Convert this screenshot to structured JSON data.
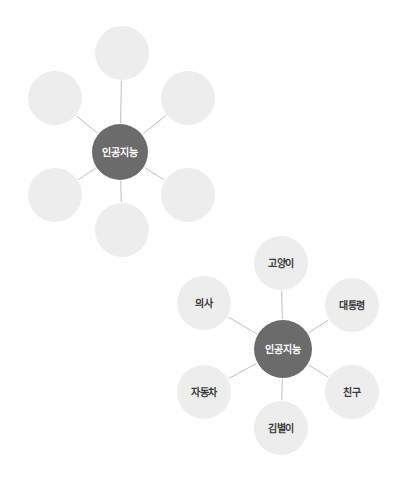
{
  "page": {
    "background_color": "#ffffff",
    "width": 410,
    "height": 497
  },
  "style": {
    "hub_fill": "#6b6b6b",
    "hub_text_color": "#ffffff",
    "leaf_fill": "#ededed",
    "leaf_text_color": "#3a3a3a",
    "edge_color": "#bfbfbf"
  },
  "diagrams": [
    {
      "id": "diagram-unlabeled",
      "name": "radial-diagram-unlabeled",
      "center": {
        "label": "인공지능",
        "x": 120,
        "y": 152,
        "r": 28
      },
      "nodes": [
        {
          "label": "",
          "x": 122,
          "y": 53,
          "r": 27
        },
        {
          "label": "",
          "x": 188,
          "y": 98,
          "r": 27
        },
        {
          "label": "",
          "x": 188,
          "y": 195,
          "r": 27
        },
        {
          "label": "",
          "x": 122,
          "y": 230,
          "r": 27
        },
        {
          "label": "",
          "x": 55,
          "y": 195,
          "r": 27
        },
        {
          "label": "",
          "x": 55,
          "y": 98,
          "r": 27
        }
      ]
    },
    {
      "id": "diagram-labeled",
      "name": "radial-diagram-labeled",
      "center": {
        "label": "인공지능",
        "x": 283,
        "y": 349,
        "r": 29
      },
      "nodes": [
        {
          "label": "고양이",
          "x": 281,
          "y": 263,
          "r": 27
        },
        {
          "label": "대통령",
          "x": 352,
          "y": 305,
          "r": 27
        },
        {
          "label": "친구",
          "x": 352,
          "y": 392,
          "r": 27
        },
        {
          "label": "김별이",
          "x": 281,
          "y": 428,
          "r": 27
        },
        {
          "label": "자동차",
          "x": 204,
          "y": 392,
          "r": 27
        },
        {
          "label": "의사",
          "x": 204,
          "y": 303,
          "r": 27
        }
      ]
    }
  ]
}
